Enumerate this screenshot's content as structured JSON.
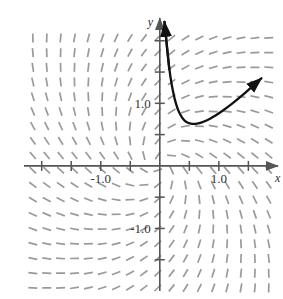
{
  "problem": {
    "number": "4."
  },
  "figure": {
    "kind": "slope-field-with-solution-curve",
    "background": "#ffffff",
    "axis_color": "#555555",
    "slope_mark_color": "#9a9a9a",
    "curve_color": "#111111"
  },
  "axes": {
    "x_label": "x",
    "y_label": "y",
    "x_ticks": [
      {
        "value": -2.0,
        "label": ""
      },
      {
        "value": -1.5,
        "label": ""
      },
      {
        "value": -1.0,
        "label": "-1.0"
      },
      {
        "value": -0.5,
        "label": ""
      },
      {
        "value": 0.5,
        "label": ""
      },
      {
        "value": 1.0,
        "label": "1.0"
      },
      {
        "value": 1.5,
        "label": ""
      }
    ],
    "y_ticks": [
      {
        "value": 2.0,
        "label": ""
      },
      {
        "value": 1.5,
        "label": ""
      },
      {
        "value": 1.0,
        "label": "1.0"
      },
      {
        "value": 0.5,
        "label": ""
      },
      {
        "value": -0.5,
        "label": ""
      },
      {
        "value": -1.0,
        "label": "-1.0"
      },
      {
        "value": -1.5,
        "label": ""
      }
    ],
    "xlim": [
      -2.3,
      1.9
    ],
    "ylim": [
      -2.0,
      2.3
    ]
  },
  "chart_data": {
    "type": "line",
    "title": "",
    "xlabel": "x",
    "ylabel": "y",
    "xlim": [
      -2.3,
      1.9
    ],
    "ylim": [
      -2.0,
      2.3
    ],
    "grid": false,
    "legend": "none",
    "series": [
      {
        "name": "solution-curve",
        "comment": "U-shaped solution curve, steeply rising as x approaches 0 from the right, minimum near x = 0.55, increasing to the right with an arrowhead",
        "x": [
          0.08,
          0.12,
          0.16,
          0.2,
          0.25,
          0.3,
          0.35,
          0.4,
          0.45,
          0.5,
          0.55,
          0.6,
          0.7,
          0.8,
          0.9,
          1.0,
          1.15,
          1.3,
          1.45,
          1.6,
          1.72
        ],
        "y": [
          2.3,
          1.9,
          1.55,
          1.3,
          1.07,
          0.91,
          0.81,
          0.74,
          0.7,
          0.68,
          0.67,
          0.67,
          0.69,
          0.73,
          0.78,
          0.84,
          0.94,
          1.05,
          1.17,
          1.3,
          1.4
        ],
        "arrow_start": true,
        "arrow_end": true
      }
    ],
    "slope_field": {
      "comment": "Direction field tick marks on a regular lattice; slope at each point suggests dy/dx = (y - x)/(x + y) style rotational behaviour: near-vertical in upper-left and lower-right, swirling through horizontal across the lower-left and upper-right",
      "x_start": -2.15,
      "x_end": 1.85,
      "x_step": 0.235,
      "y_start": -1.95,
      "y_end": 2.25,
      "y_step": 0.235,
      "mark_length_px": 9
    }
  }
}
